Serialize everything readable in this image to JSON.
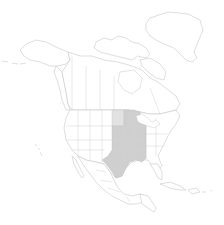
{
  "map": {
    "region": "North America",
    "type": "species range / distribution map",
    "projection": "polar-ish conic (Greenland top right, Alaska top left)",
    "labels": [],
    "colors": {
      "background": "#ffffff",
      "land_fill": "#ffffff",
      "boundary_lines": "#c8c8c8",
      "range_primary": "#cfcfcf",
      "range_secondary": "#e2e2e2"
    },
    "highlighted_regions": {
      "primary": [
        "Texas",
        "Oklahoma",
        "Kansas",
        "Nebraska",
        "Iowa",
        "Missouri",
        "Arkansas",
        "Louisiana",
        "Mississippi",
        "Illinois",
        "Wisconsin",
        "Minnesota",
        "Michigan",
        "Indiana",
        "Kentucky",
        "Tennessee"
      ],
      "secondary": [
        "North Dakota",
        "South Dakota"
      ]
    },
    "visible_features": [
      "Greenland",
      "Canadian Arctic Archipelago",
      "Alaska",
      "Canada provinces",
      "United States states",
      "Mexico states",
      "Cuba / Caribbean",
      "Central America",
      "Hawaii (inset-like, left)"
    ]
  }
}
